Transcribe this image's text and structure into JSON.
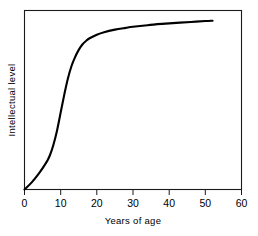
{
  "chart_data": {
    "type": "line",
    "title": "",
    "subtitle": "",
    "xlabel": "Years of age",
    "ylabel": "Intellectual level",
    "xlim": [
      0,
      60
    ],
    "ylim": [
      0,
      1
    ],
    "xticks": [
      0,
      10,
      20,
      30,
      40,
      50,
      60
    ],
    "xtick_labels": [
      "0",
      "10",
      "20",
      "30",
      "40",
      "50",
      "60"
    ],
    "yticks": [],
    "ytick_labels": [],
    "grid": false,
    "legend": null,
    "annotations": [],
    "series": [
      {
        "name": "Intellectual level",
        "color": "#000000",
        "x": [
          0,
          2,
          4,
          6,
          7,
          8,
          9,
          10,
          11,
          12,
          13,
          14,
          15,
          16,
          17,
          18,
          20,
          22,
          25,
          28,
          30,
          34,
          38,
          42,
          46,
          50,
          52
        ],
        "y": [
          0.0,
          0.04,
          0.09,
          0.15,
          0.19,
          0.25,
          0.33,
          0.43,
          0.53,
          0.62,
          0.69,
          0.74,
          0.78,
          0.81,
          0.83,
          0.845,
          0.865,
          0.879,
          0.893,
          0.903,
          0.909,
          0.918,
          0.925,
          0.931,
          0.936,
          0.941,
          0.943
        ]
      }
    ]
  },
  "figure": {
    "curve_start_age": 0,
    "curve_end_age": 52,
    "axis_color": "#1a1a1a",
    "curve_color": "#000000",
    "background_color": "#ffffff"
  }
}
